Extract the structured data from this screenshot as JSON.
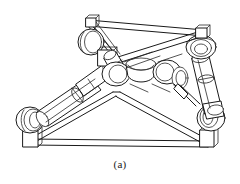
{
  "figure": {
    "caption": "(a)",
    "style": "black-and-white engineering line drawing",
    "background_color": "#ffffff",
    "line_color": "#1a1a1a",
    "fill_color": "#ffffff"
  },
  "parts": {
    "top_platform": "triangular moving platform",
    "base_frame": "triangular fixed base frame",
    "leg_left": "left linear actuator leg",
    "leg_right": "right linear actuator leg",
    "leg_rear": "rear linear actuator leg",
    "joint_center": "central spherical joint cluster",
    "joint_top_left": "upper-left spherical joint",
    "joint_top_right": "upper-right spherical joint",
    "joint_base_left": "lower-left base spherical joint",
    "joint_base_right": "lower-right base spherical joint",
    "post_top_left": "top platform left corner post",
    "post_top_right": "top platform right corner post",
    "post_base_left": "base left corner post",
    "post_base_right": "base right corner post"
  }
}
